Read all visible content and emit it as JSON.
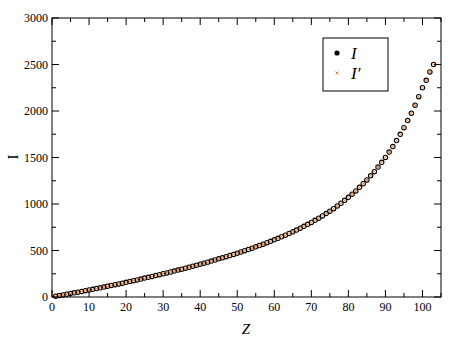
{
  "chart_data": {
    "type": "scatter",
    "title": "",
    "xlabel": "Z",
    "ylabel": "I",
    "xlim": [
      0,
      105
    ],
    "ylim": [
      0,
      3000
    ],
    "grid": false,
    "legend_position": "upper right (inside)",
    "x_ticks": [
      0,
      10,
      20,
      30,
      40,
      50,
      60,
      70,
      80,
      90,
      100
    ],
    "y_ticks": [
      0,
      500,
      1000,
      1500,
      2000,
      2500,
      3000
    ],
    "series": [
      {
        "name": "I",
        "marker": "open circle (black)",
        "color": "#000000",
        "x": [
          1,
          2,
          3,
          4,
          5,
          6,
          7,
          8,
          9,
          10,
          11,
          12,
          13,
          14,
          15,
          16,
          17,
          18,
          19,
          20,
          21,
          22,
          23,
          24,
          25,
          26,
          27,
          28,
          29,
          30,
          31,
          32,
          33,
          34,
          35,
          36,
          37,
          38,
          39,
          40,
          41,
          42,
          43,
          44,
          45,
          46,
          47,
          48,
          49,
          50,
          51,
          52,
          53,
          54,
          55,
          56,
          57,
          58,
          59,
          60,
          61,
          62,
          63,
          64,
          65,
          66,
          67,
          68,
          69,
          70,
          71,
          72,
          73,
          74,
          75,
          76,
          77,
          78,
          79,
          80,
          81,
          82,
          83,
          84,
          85,
          86,
          87,
          88,
          89,
          90,
          91,
          92,
          93,
          94,
          95,
          96,
          97,
          98,
          99,
          100,
          101,
          102,
          103
        ],
        "values": [
          8,
          15,
          22,
          30,
          37,
          45,
          52,
          60,
          68,
          75,
          83,
          91,
          99,
          107,
          116,
          124,
          132,
          141,
          149,
          158,
          167,
          176,
          184,
          193,
          203,
          212,
          221,
          230,
          240,
          250,
          259,
          269,
          279,
          289,
          299,
          310,
          320,
          331,
          342,
          353,
          364,
          375,
          386,
          398,
          410,
          421,
          434,
          446,
          458,
          471,
          484,
          498,
          511,
          525,
          539,
          554,
          568,
          584,
          599,
          615,
          631,
          648,
          665,
          683,
          701,
          720,
          740,
          760,
          781,
          802,
          825,
          848,
          872,
          897,
          923,
          950,
          979,
          1008,
          1039,
          1072,
          1106,
          1141,
          1179,
          1218,
          1259,
          1303,
          1348,
          1397,
          1448,
          1501,
          1558,
          1618,
          1682,
          1749,
          1821,
          1897,
          1977,
          2063,
          2154,
          2250,
          2330,
          2420,
          2500
        ]
      },
      {
        "name": "I'",
        "marker": "x (orange)",
        "color": "#e8853a",
        "x": [
          1,
          2,
          3,
          4,
          5,
          6,
          7,
          8,
          9,
          10,
          11,
          12,
          13,
          14,
          15,
          16,
          17,
          18,
          19,
          20,
          21,
          22,
          23,
          24,
          25,
          26,
          27,
          28,
          29,
          30,
          31,
          32,
          33,
          34,
          35,
          36,
          37,
          38,
          39,
          40,
          41,
          42,
          43,
          44,
          45,
          46,
          47,
          48,
          49,
          50,
          51,
          52,
          53,
          54,
          55,
          56,
          57,
          58,
          59,
          60,
          61,
          62,
          63,
          64,
          65,
          66,
          67,
          68,
          69,
          70,
          71,
          72,
          73,
          74,
          75,
          76,
          77,
          78,
          79,
          80,
          81,
          82,
          83,
          84,
          85,
          86,
          87,
          88,
          89,
          90,
          91,
          92,
          93,
          94,
          95,
          96,
          97,
          98,
          99,
          100,
          101,
          102,
          103
        ],
        "values": [
          8,
          15,
          22,
          30,
          37,
          45,
          52,
          60,
          68,
          75,
          83,
          91,
          99,
          107,
          116,
          124,
          132,
          141,
          149,
          158,
          167,
          176,
          184,
          193,
          203,
          212,
          221,
          230,
          240,
          250,
          259,
          269,
          279,
          289,
          299,
          310,
          320,
          331,
          342,
          353,
          364,
          375,
          386,
          398,
          410,
          421,
          434,
          446,
          458,
          471,
          484,
          498,
          511,
          525,
          539,
          554,
          568,
          584,
          599,
          615,
          631,
          648,
          665,
          683,
          701,
          720,
          740,
          760,
          781,
          802,
          825,
          848,
          872,
          897,
          923,
          950,
          979,
          1008,
          1039,
          1072,
          1106,
          1141,
          1179,
          1218,
          1259,
          1303,
          1348,
          1397,
          1448,
          1501,
          1558,
          1618,
          1682,
          1749,
          1821,
          1897,
          1977,
          2063,
          2154,
          2250,
          2330,
          2420,
          2500
        ]
      }
    ]
  },
  "legend": {
    "entries": [
      {
        "label": "I",
        "color": "#000000"
      },
      {
        "label": "I′",
        "color": "#e8853a"
      }
    ]
  },
  "axes": {
    "xlabel": "Z",
    "ylabel": "I"
  }
}
